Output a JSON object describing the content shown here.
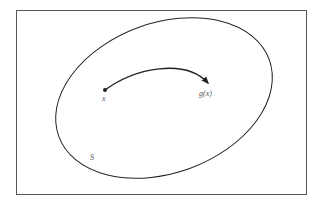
{
  "diagram": {
    "labels": {
      "point": "x",
      "image": "g(x)",
      "set": "S"
    },
    "colors": {
      "stroke": "#222222",
      "frame": "#555555",
      "label": "#555555",
      "background": "#ffffff"
    }
  }
}
